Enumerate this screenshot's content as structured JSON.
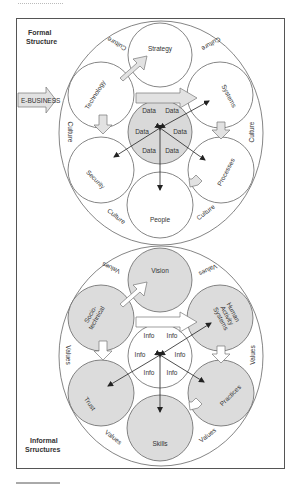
{
  "formal": {
    "heading_line1": "Formal",
    "heading_line2": "Structure",
    "input_label": "E-BUSINESS",
    "ring_label": "Culture",
    "center_label": "Data",
    "nodes": {
      "top": "Strategy",
      "upper_left": "Technology",
      "upper_right": "Systems",
      "lower_left": "Security",
      "lower_right": "Processes",
      "bottom": "People"
    }
  },
  "informal": {
    "heading_line1": "Informal",
    "heading_line2": "Srructures",
    "ring_label": "Values",
    "center_label": "Info",
    "nodes": {
      "top": "Vision",
      "upper_left_line1": "Socio-",
      "upper_left_line2": "technical",
      "upper_right_line1": "Human",
      "upper_right_line2": "Activity",
      "upper_right_line3": "Systems",
      "lower_left": "Trust",
      "lower_right": "Practices",
      "bottom": "Skills"
    }
  },
  "colors": {
    "frame": "#555555",
    "circle_stroke": "#666666",
    "formal_center_fill": "#d9d9d9",
    "informal_fill": "#dcdcdc",
    "arrow_fill": "#e2e2e2"
  }
}
